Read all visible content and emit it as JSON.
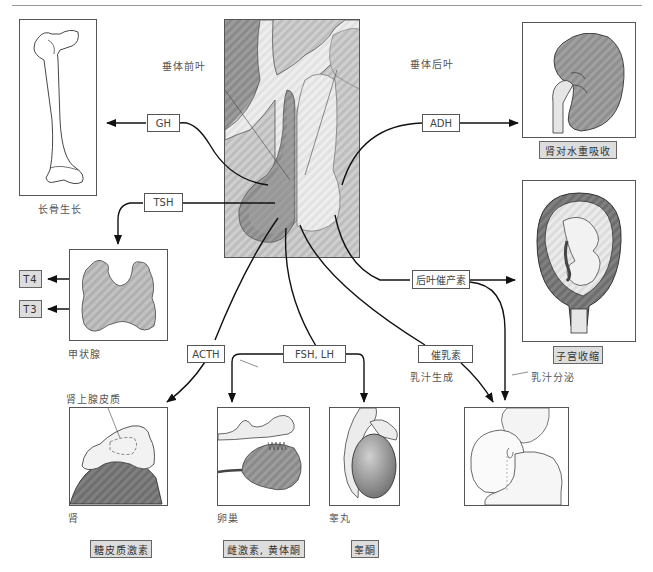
{
  "diagram": {
    "pituitary": {
      "anterior_label": "垂体前叶",
      "posterior_label": "垂体后叶"
    },
    "hormones": {
      "gh": "GH",
      "tsh": "TSH",
      "adh": "ADH",
      "acth": "ACTH",
      "fsh_lh": "FSH, LH",
      "prolactin": "催乳素",
      "oxytocin": "后叶催产素"
    },
    "targets": {
      "bone": {
        "caption": "长骨生长"
      },
      "kidney": {
        "effect": "肾对水重吸收"
      },
      "thyroid": {
        "caption": "甲状腺",
        "outputs": [
          "T4",
          "T3"
        ]
      },
      "uterus": {
        "effect": "子宫收缩"
      },
      "adrenal": {
        "structure_label": "肾上腺皮质",
        "caption": "肾",
        "output": "糖皮质激素"
      },
      "ovary": {
        "caption": "卵巢",
        "output": "雌激素, 黄体酮"
      },
      "testis": {
        "caption": "睾丸",
        "output": "睾酮"
      },
      "breast": {
        "milk_production": "乳汁生成",
        "milk_ejection": "乳汁分泌"
      }
    },
    "colors": {
      "line": "#111111",
      "panel_border": "#555555",
      "organ_dark": "#7a7a7a",
      "organ_mid": "#a8a8a8",
      "organ_light": "#e4e4e4",
      "highlight_box": "#dddddd"
    }
  }
}
